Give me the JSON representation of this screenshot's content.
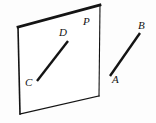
{
  "figure": {
    "background_color": "#fdfdfd",
    "stroke_color": "#141414",
    "label_color": "#141414",
    "width": 156,
    "height": 123,
    "plane": {
      "name": "P",
      "label": "P",
      "label_x": 83,
      "label_y": 16,
      "corners": [
        {
          "name": "top-left",
          "x": 18,
          "y": 27
        },
        {
          "name": "top-right",
          "x": 100,
          "y": 5
        },
        {
          "name": "bottom-right",
          "x": 99,
          "y": 96
        },
        {
          "name": "bottom-left",
          "x": 20,
          "y": 114
        }
      ],
      "points_path": "18,27 100,5 99,96 20,114",
      "edges": [
        {
          "name": "top-edge",
          "x1": 18,
          "y1": 27,
          "x2": 100,
          "y2": 5,
          "width": 2.6
        },
        {
          "name": "right-edge",
          "x1": 100,
          "y1": 5,
          "x2": 99,
          "y2": 96,
          "width": 1.1
        },
        {
          "name": "bottom-edge",
          "x1": 99,
          "y1": 96,
          "x2": 20,
          "y2": 114,
          "width": 1.1
        },
        {
          "name": "left-edge",
          "x1": 20,
          "y1": 114,
          "x2": 18,
          "y2": 27,
          "width": 1.5
        }
      ]
    },
    "segments": [
      {
        "name": "segment-CD",
        "label": "CD",
        "x1": 37,
        "y1": 81,
        "x2": 68,
        "y2": 41,
        "width": 2.4,
        "endpoints": [
          {
            "label": "C",
            "x": 37,
            "y": 81,
            "label_x": 25,
            "label_y": 78
          },
          {
            "label": "D",
            "x": 68,
            "y": 41,
            "label_x": 59,
            "label_y": 27
          }
        ]
      },
      {
        "name": "segment-AB",
        "label": "AB",
        "x1": 110,
        "y1": 76,
        "x2": 140,
        "y2": 33,
        "width": 2.4,
        "endpoints": [
          {
            "label": "A",
            "x": 110,
            "y": 76,
            "label_x": 112,
            "label_y": 75
          },
          {
            "label": "B",
            "x": 140,
            "y": 33,
            "label_x": 138,
            "label_y": 20
          }
        ]
      }
    ],
    "labels": [
      {
        "name": "label-P",
        "text": "P",
        "x": 83,
        "y": 16
      },
      {
        "name": "label-D",
        "text": "D",
        "x": 59,
        "y": 27
      },
      {
        "name": "label-C",
        "text": "C",
        "x": 25,
        "y": 77
      },
      {
        "name": "label-B",
        "text": "B",
        "x": 138,
        "y": 20
      },
      {
        "name": "label-A",
        "text": "A",
        "x": 112,
        "y": 74
      }
    ]
  }
}
